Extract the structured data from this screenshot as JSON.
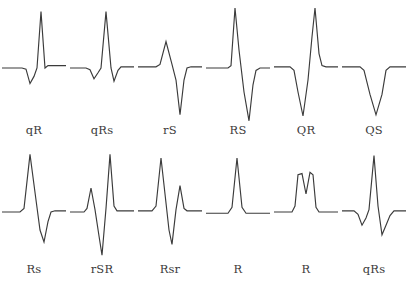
{
  "figure": {
    "stroke_color": "#3b3b3b",
    "background_color": "#ffffff",
    "rows": 2,
    "columns": 6
  },
  "chart_data": {
    "type": "line",
    "subtitle": "",
    "xlabel": "",
    "ylabel": "",
    "grid": false,
    "legend": "none",
    "axis_ranges": {
      "x": [
        0,
        100
      ],
      "y": [
        -100,
        100
      ]
    },
    "baseline_y": 0,
    "note": "Each panel is a single-trace ECG QRS morphology drawn on a flat isoelectric baseline; the label beneath each panel is the standard QRS nomenclature (capital letters = large deflections, lowercase = small deflections).",
    "series": [
      {
        "name": "qR",
        "row": 1,
        "column": 1,
        "label": "qR",
        "description": "Small negative q deflection followed by a tall positive R deflection.",
        "points": [
          [
            2,
            0
          ],
          [
            22,
            0
          ],
          [
            26,
            -2
          ],
          [
            30,
            -26
          ],
          [
            34,
            -14
          ],
          [
            37,
            0
          ],
          [
            41,
            94
          ],
          [
            45,
            0
          ],
          [
            48,
            4
          ],
          [
            52,
            4
          ],
          [
            66,
            4
          ]
        ]
      },
      {
        "name": "qRs",
        "row": 1,
        "column": 2,
        "label": "qRs",
        "description": "Small negative q, tall positive R, then a small negative s deflection.",
        "points": [
          [
            2,
            0
          ],
          [
            18,
            0
          ],
          [
            22,
            -3
          ],
          [
            26,
            -18
          ],
          [
            30,
            -8
          ],
          [
            33,
            0
          ],
          [
            38,
            94
          ],
          [
            43,
            0
          ],
          [
            46,
            -22
          ],
          [
            50,
            -4
          ],
          [
            53,
            2
          ],
          [
            66,
            2
          ]
        ]
      },
      {
        "name": "rS",
        "row": 1,
        "column": 3,
        "label": "rS",
        "description": "Small positive r deflection followed by a deep negative S deflection.",
        "points": [
          [
            2,
            2
          ],
          [
            20,
            2
          ],
          [
            24,
            6
          ],
          [
            30,
            44
          ],
          [
            36,
            6
          ],
          [
            40,
            -20
          ],
          [
            44,
            -78
          ],
          [
            48,
            -20
          ],
          [
            51,
            0
          ],
          [
            55,
            2
          ],
          [
            66,
            2
          ]
        ]
      },
      {
        "name": "RS",
        "row": 1,
        "column": 4,
        "label": "RS",
        "description": "Tall positive R deflection followed by a deep negative S deflection.",
        "points": [
          [
            2,
            0
          ],
          [
            24,
            0
          ],
          [
            27,
            4
          ],
          [
            31,
            100
          ],
          [
            35,
            30
          ],
          [
            40,
            -40
          ],
          [
            45,
            -88
          ],
          [
            49,
            -28
          ],
          [
            52,
            -4
          ],
          [
            56,
            0
          ],
          [
            66,
            0
          ]
        ]
      },
      {
        "name": "QR",
        "row": 1,
        "column": 5,
        "label": "QR",
        "description": "Deep initial negative Q deflection followed by a tall positive R deflection.",
        "points": [
          [
            2,
            2
          ],
          [
            18,
            2
          ],
          [
            22,
            -4
          ],
          [
            26,
            -40
          ],
          [
            31,
            -80
          ],
          [
            36,
            -20
          ],
          [
            40,
            52
          ],
          [
            43,
            100
          ],
          [
            47,
            24
          ],
          [
            50,
            4
          ],
          [
            54,
            2
          ],
          [
            66,
            2
          ]
        ]
      },
      {
        "name": "QS",
        "row": 1,
        "column": 6,
        "label": "QS",
        "description": "Single entirely negative QS deflection with no positive component.",
        "points": [
          [
            2,
            2
          ],
          [
            20,
            2
          ],
          [
            24,
            -4
          ],
          [
            30,
            -44
          ],
          [
            36,
            -78
          ],
          [
            42,
            -44
          ],
          [
            46,
            -4
          ],
          [
            50,
            2
          ],
          [
            66,
            2
          ]
        ]
      },
      {
        "name": "Rs",
        "row": 2,
        "column": 1,
        "label": "Rs",
        "description": "Tall positive R deflection followed by a small negative s deflection.",
        "points": [
          [
            2,
            0
          ],
          [
            20,
            0
          ],
          [
            24,
            6
          ],
          [
            30,
            96
          ],
          [
            36,
            20
          ],
          [
            40,
            -30
          ],
          [
            44,
            -50
          ],
          [
            48,
            -16
          ],
          [
            51,
            0
          ],
          [
            55,
            2
          ],
          [
            66,
            2
          ]
        ]
      },
      {
        "name": "rSR",
        "row": 2,
        "column": 2,
        "label": "rSR",
        "description": "Small r, deep negative S, then a tall positive R prime deflection.",
        "points": [
          [
            2,
            0
          ],
          [
            16,
            0
          ],
          [
            19,
            6
          ],
          [
            23,
            40
          ],
          [
            27,
            4
          ],
          [
            31,
            -40
          ],
          [
            34,
            -72
          ],
          [
            38,
            6
          ],
          [
            42,
            96
          ],
          [
            46,
            10
          ],
          [
            49,
            2
          ],
          [
            53,
            2
          ],
          [
            66,
            2
          ]
        ]
      },
      {
        "name": "Rsr",
        "row": 2,
        "column": 3,
        "label": "Rsr",
        "description": "Tall positive R, small negative s, then a small positive r prime deflection.",
        "points": [
          [
            2,
            2
          ],
          [
            16,
            2
          ],
          [
            20,
            10
          ],
          [
            25,
            90
          ],
          [
            29,
            30
          ],
          [
            33,
            -30
          ],
          [
            36,
            -54
          ],
          [
            40,
            4
          ],
          [
            44,
            44
          ],
          [
            48,
            6
          ],
          [
            51,
            2
          ],
          [
            55,
            2
          ],
          [
            66,
            2
          ]
        ]
      },
      {
        "name": "R",
        "row": 2,
        "column": 4,
        "label": "R",
        "description": "Single monophasic positive R deflection with no negative component.",
        "points": [
          [
            2,
            -2
          ],
          [
            24,
            -2
          ],
          [
            28,
            8
          ],
          [
            33,
            90
          ],
          [
            38,
            8
          ],
          [
            42,
            -2
          ],
          [
            66,
            -2
          ]
        ]
      },
      {
        "name": "R-notched",
        "row": 2,
        "column": 5,
        "label": "R",
        "description": "Notched (M-shaped) positive R deflection; the notch does not cross the baseline.",
        "points": [
          [
            2,
            0
          ],
          [
            20,
            0
          ],
          [
            23,
            10
          ],
          [
            26,
            62
          ],
          [
            30,
            64
          ],
          [
            34,
            30
          ],
          [
            38,
            66
          ],
          [
            41,
            62
          ],
          [
            44,
            8
          ],
          [
            47,
            0
          ],
          [
            66,
            0
          ]
        ]
      },
      {
        "name": "qRs-2",
        "row": 2,
        "column": 6,
        "label": "qRs",
        "description": "Small negative q, tall positive R, then a negative s deflection returning to baseline.",
        "points": [
          [
            2,
            2
          ],
          [
            14,
            2
          ],
          [
            18,
            -4
          ],
          [
            22,
            -22
          ],
          [
            26,
            -10
          ],
          [
            29,
            4
          ],
          [
            34,
            94
          ],
          [
            38,
            10
          ],
          [
            42,
            -38
          ],
          [
            46,
            -22
          ],
          [
            50,
            -6
          ],
          [
            54,
            2
          ],
          [
            66,
            2
          ]
        ]
      }
    ]
  }
}
